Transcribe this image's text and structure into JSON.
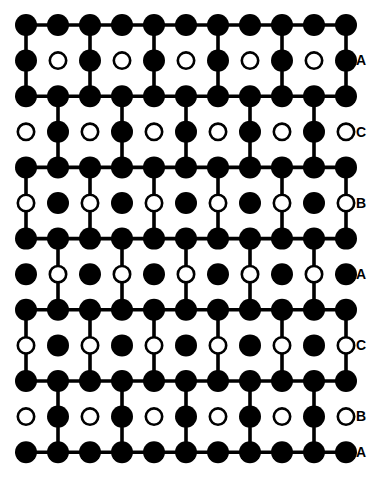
{
  "figure": {
    "type": "crystal-lattice-schematic",
    "width": 367,
    "height": 484,
    "background_color": "#ffffff",
    "ink_color": "#000000"
  },
  "lattice": {
    "columns": 11,
    "rows": 13,
    "x_start": 26,
    "x_step": 32,
    "y_start": 25,
    "y_step": 35.6,
    "atom_radius_filled": 11,
    "atom_radius_open": 9.5,
    "open_atom_stroke_width": 2.6,
    "bond_width": 3.6,
    "row_kinds": [
      "all-filled",
      "mixed-filled-first",
      "all-filled",
      "mixed-open-first",
      "all-filled",
      "mixed-open-first",
      "all-filled",
      "mixed-filled-first",
      "all-filled",
      "mixed-open-first",
      "all-filled",
      "mixed-open-first",
      "all-filled"
    ],
    "row_first_is_filled": [
      true,
      true,
      true,
      false,
      true,
      false,
      true,
      true,
      true,
      false,
      true,
      false,
      true
    ],
    "row_has_horizontal_bonds": [
      true,
      false,
      true,
      false,
      true,
      false,
      true,
      false,
      true,
      false,
      true,
      false,
      true
    ],
    "vertical_bond_parity_per_gap": [
      0,
      0,
      1,
      1,
      0,
      0,
      1,
      1,
      0,
      0,
      1,
      1
    ],
    "labels": [
      {
        "text": "A",
        "row": 1,
        "marker": "filled"
      },
      {
        "text": "C",
        "row": 3,
        "marker": "open"
      },
      {
        "text": "B",
        "row": 5,
        "marker": "open"
      },
      {
        "text": "A",
        "row": 7,
        "marker": "filled"
      },
      {
        "text": "C",
        "row": 9,
        "marker": "open"
      },
      {
        "text": "B",
        "row": 11,
        "marker": "open"
      },
      {
        "text": "A",
        "row": 12,
        "marker": "filled"
      }
    ],
    "label_x": 356,
    "label_font_size": 14,
    "legend": {
      "filled_meaning": "filled-circle-atom",
      "open_meaning": "open-circle-atom"
    }
  }
}
